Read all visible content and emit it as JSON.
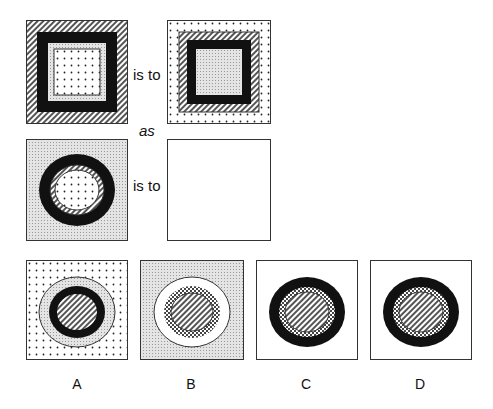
{
  "problem": {
    "relation_text_1": "is to",
    "relation_text_2": "is to",
    "as_text": "as"
  },
  "figures": {
    "q1": {
      "shape": "square",
      "layers_outer_to_inner": [
        "hatched",
        "black",
        "light-grey",
        "dotted-white"
      ]
    },
    "q2": {
      "shape": "square",
      "layers_outer_to_inner": [
        "dotted-white",
        "hatched",
        "black",
        "light-grey"
      ]
    },
    "q3": {
      "shape": "circle",
      "background": "light-grey",
      "layers_outer_to_inner": [
        "black",
        "hatched",
        "dotted-white"
      ]
    },
    "q4": {
      "shape": "empty"
    }
  },
  "options": [
    {
      "label": "A",
      "background": "dotted-white",
      "layers_outer_to_inner": [
        "light-grey",
        "black",
        "hatched"
      ]
    },
    {
      "label": "B",
      "background": "light-grey",
      "layers_outer_to_inner": [
        "white",
        "checker",
        "hatched"
      ]
    },
    {
      "label": "C",
      "background": "white",
      "layers_outer_to_inner": [
        "black",
        "checker",
        "hatched"
      ]
    },
    {
      "label": "D",
      "background": "white",
      "layers_outer_to_inner": [
        "black",
        "checker",
        "hatched"
      ]
    }
  ],
  "colors": {
    "black": "#111111",
    "grey": "#d8d8d8",
    "hatch": "#555555",
    "border": "#333333"
  }
}
